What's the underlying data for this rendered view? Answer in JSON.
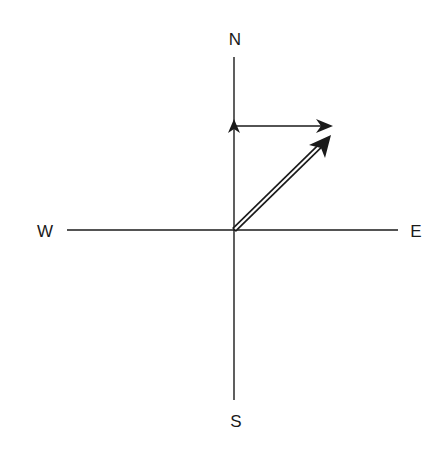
{
  "diagram": {
    "title": "",
    "type": "vector-addition-compass",
    "labels": {
      "north": "N",
      "south": "S",
      "east": "E",
      "west": "W"
    },
    "colors": {
      "ink": "#1a1a1a",
      "background": "#ffffff"
    },
    "origin": {
      "x": 234,
      "y": 230
    },
    "axes": {
      "vertical": {
        "x": 234,
        "y_top": 57,
        "y_bottom": 400
      },
      "horizontal": {
        "y": 230,
        "x_left": 67,
        "x_right": 398
      }
    },
    "vectors": [
      {
        "name": "north-component",
        "style": "single-line",
        "from": [
          234,
          230
        ],
        "to": [
          234,
          119
        ]
      },
      {
        "name": "east-component",
        "style": "single-line",
        "from": [
          234,
          126
        ],
        "to": [
          333,
          126
        ]
      },
      {
        "name": "resultant",
        "style": "double-line",
        "from": [
          234,
          230
        ],
        "to": [
          331,
          135
        ]
      }
    ]
  }
}
